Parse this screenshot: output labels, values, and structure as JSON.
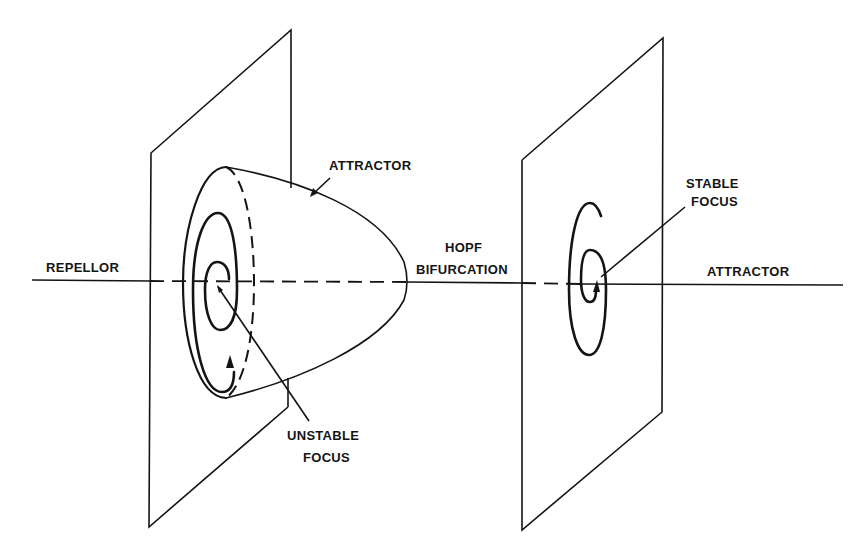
{
  "diagram": {
    "type": "hopf-bifurcation-schematic",
    "labels": {
      "repellor": "REPELLOR",
      "attractor_cone": "ATTRACTOR",
      "unstable_focus_line1": "UNSTABLE",
      "unstable_focus_line2": "FOCUS",
      "hopf_line1": "HOPF",
      "hopf_line2": "BIFURCATION",
      "stable_focus_line1": "STABLE",
      "stable_focus_line2": "FOCUS",
      "attractor_right": "ATTRACTOR"
    },
    "colors": {
      "ink": "#141414",
      "background": "#ffffff"
    },
    "elements": [
      "left-phase-plane",
      "limit-cycle-cone",
      "unstable-spiral",
      "axis-line",
      "right-phase-plane",
      "stable-spiral"
    ]
  }
}
